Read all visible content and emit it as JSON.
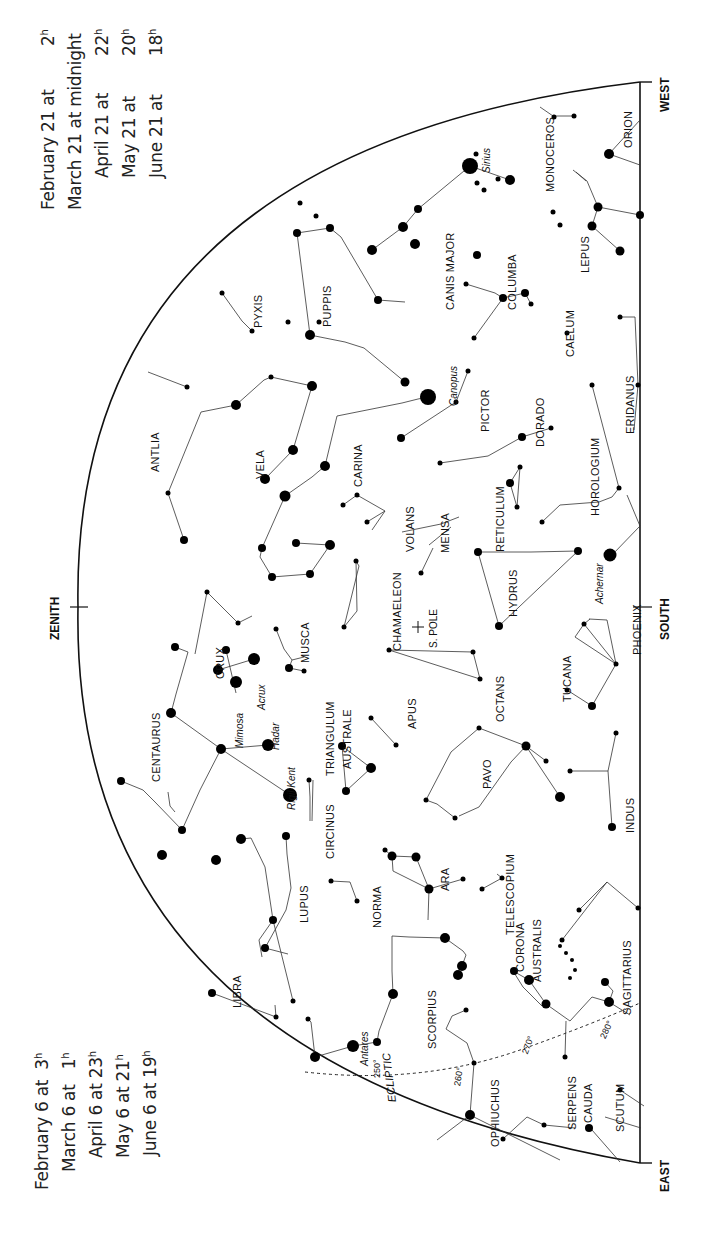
{
  "times_west": [
    {
      "date": "February 21 at",
      "time": "2",
      "unit": "h"
    },
    {
      "date": "March 21 at midnight",
      "time": "",
      "unit": ""
    },
    {
      "date": "April 21 at",
      "time": "22",
      "unit": "h"
    },
    {
      "date": "May 21 at",
      "time": "20",
      "unit": "h"
    },
    {
      "date": "June 21 at",
      "time": "18",
      "unit": "h"
    }
  ],
  "times_east": [
    {
      "date": "February 6 at",
      "time": "3",
      "unit": "h"
    },
    {
      "date": "March 6 at",
      "time": "1",
      "unit": "h"
    },
    {
      "date": "April 6 at",
      "time": "23",
      "unit": "h"
    },
    {
      "date": "May 6 at",
      "time": "21",
      "unit": "h"
    },
    {
      "date": "June 6 at",
      "time": "19",
      "unit": "h"
    }
  ],
  "directions": {
    "west": "WEST",
    "south": "SOUTH",
    "east": "EAST",
    "zenith": "ZENITH"
  },
  "pole_label": "S. POLE",
  "ecliptic": {
    "label": "ECLIPTIC",
    "degrees": [
      "250°",
      "260°",
      "270°",
      "280°"
    ]
  },
  "constellations": [
    {
      "name": "ORION",
      "x": 628,
      "y": 130
    },
    {
      "name": "MONOCEROS",
      "x": 550,
      "y": 160
    },
    {
      "name": "LEPUS",
      "x": 585,
      "y": 255
    },
    {
      "name": "CANIS MAJOR",
      "x": 450,
      "y": 270
    },
    {
      "name": "COLUMBA",
      "x": 512,
      "y": 285
    },
    {
      "name": "PYXIS",
      "x": 258,
      "y": 310
    },
    {
      "name": "PUPPIS",
      "x": 327,
      "y": 305
    },
    {
      "name": "CAELUM",
      "x": 570,
      "y": 335
    },
    {
      "name": "ERIDANUS",
      "x": 630,
      "y": 405
    },
    {
      "name": "PICTOR",
      "x": 485,
      "y": 410
    },
    {
      "name": "DORADO",
      "x": 540,
      "y": 425
    },
    {
      "name": "HOROLOGIUM",
      "x": 595,
      "y": 480
    },
    {
      "name": "ANTLIA",
      "x": 155,
      "y": 450
    },
    {
      "name": "VELA",
      "x": 260,
      "y": 465
    },
    {
      "name": "CARINA",
      "x": 358,
      "y": 465
    },
    {
      "name": "RETICULUM",
      "x": 500,
      "y": 520
    },
    {
      "name": "VOLANS",
      "x": 410,
      "y": 530
    },
    {
      "name": "MENSA",
      "x": 445,
      "y": 535
    },
    {
      "name": "CHAMAELEON",
      "x": 397,
      "y": 615
    },
    {
      "name": "HYDRUS",
      "x": 513,
      "y": 595
    },
    {
      "name": "PHOENIX",
      "x": 637,
      "y": 630
    },
    {
      "name": "MUSCA",
      "x": 305,
      "y": 645
    },
    {
      "name": "CRUX",
      "x": 220,
      "y": 665
    },
    {
      "name": "TUCANA",
      "x": 567,
      "y": 680
    },
    {
      "name": "OCTANS",
      "x": 500,
      "y": 700
    },
    {
      "name": "CENTAURUS",
      "x": 156,
      "y": 750
    },
    {
      "name": "TRIANGULUM",
      "x": 330,
      "y": 740
    },
    {
      "name": "AUSTRALE",
      "x": 347,
      "y": 740
    },
    {
      "name": "APUS",
      "x": 412,
      "y": 715
    },
    {
      "name": "PAVO",
      "x": 487,
      "y": 775
    },
    {
      "name": "CIRCINUS",
      "x": 330,
      "y": 830
    },
    {
      "name": "INDUS",
      "x": 630,
      "y": 815
    },
    {
      "name": "LUPUS",
      "x": 304,
      "y": 905
    },
    {
      "name": "NORMA",
      "x": 377,
      "y": 910
    },
    {
      "name": "ARA",
      "x": 445,
      "y": 880
    },
    {
      "name": "TELESCOPIUM",
      "x": 510,
      "y": 895
    },
    {
      "name": "CORONA",
      "x": 520,
      "y": 950
    },
    {
      "name": "AUSTRALIS",
      "x": 537,
      "y": 950
    },
    {
      "name": "LIBRA",
      "x": 237,
      "y": 990
    },
    {
      "name": "SAGITTARIUS",
      "x": 627,
      "y": 975
    },
    {
      "name": "SCORPIUS",
      "x": 432,
      "y": 1020
    },
    {
      "name": "OPHIUCHUS",
      "x": 495,
      "y": 1115
    },
    {
      "name": "SERPENS",
      "x": 572,
      "y": 1105
    },
    {
      "name": "CAUDA",
      "x": 588,
      "y": 1105
    },
    {
      "name": "SCUTUM",
      "x": 620,
      "y": 1110
    }
  ],
  "star_names": [
    {
      "name": "Sirius",
      "x": 487,
      "y": 155
    },
    {
      "name": "Canopus",
      "x": 454,
      "y": 385
    },
    {
      "name": "Achernar",
      "x": 600,
      "y": 580
    },
    {
      "name": "Acrux",
      "x": 262,
      "y": 695
    },
    {
      "name": "Mimosa",
      "x": 240,
      "y": 730
    },
    {
      "name": "Hadar",
      "x": 276,
      "y": 735
    },
    {
      "name": "Rigil Kent",
      "x": 292,
      "y": 780
    },
    {
      "name": "Antares",
      "x": 365,
      "y": 1045
    }
  ]
}
